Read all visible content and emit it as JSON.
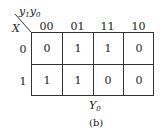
{
  "kmap": {
    "corner_col_var": "y",
    "corner_col_sub1": "1",
    "corner_col_var2": "y",
    "corner_col_sub2": "0",
    "corner_row_var": "X",
    "columns": [
      "00",
      "01",
      "11",
      "10"
    ],
    "rows": [
      {
        "label": "0",
        "cells": [
          "0",
          "1",
          "1",
          "0"
        ]
      },
      {
        "label": "1",
        "cells": [
          "1",
          "1",
          "0",
          "0"
        ]
      }
    ],
    "output_var": "Y",
    "output_sub": "0",
    "caption": "(b)"
  }
}
